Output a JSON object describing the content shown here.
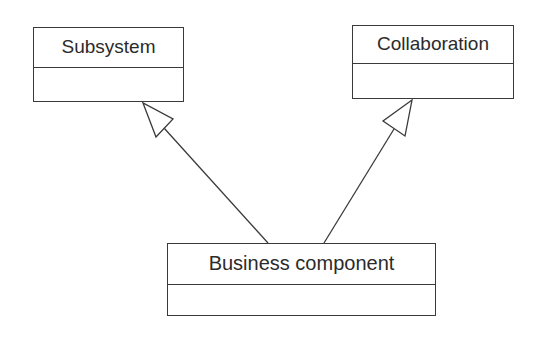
{
  "diagram": {
    "type": "uml-class-generalization",
    "classes": [
      {
        "id": "subsystem",
        "name": "Subsystem"
      },
      {
        "id": "collaboration",
        "name": "Collaboration"
      },
      {
        "id": "business_component",
        "name": "Business component"
      }
    ],
    "relations": [
      {
        "from": "business_component",
        "to": "subsystem",
        "kind": "generalization"
      },
      {
        "from": "business_component",
        "to": "collaboration",
        "kind": "generalization"
      }
    ],
    "colors": {
      "line": "#3a3a3a",
      "text": "#2b2b2b",
      "background": "#ffffff"
    }
  }
}
